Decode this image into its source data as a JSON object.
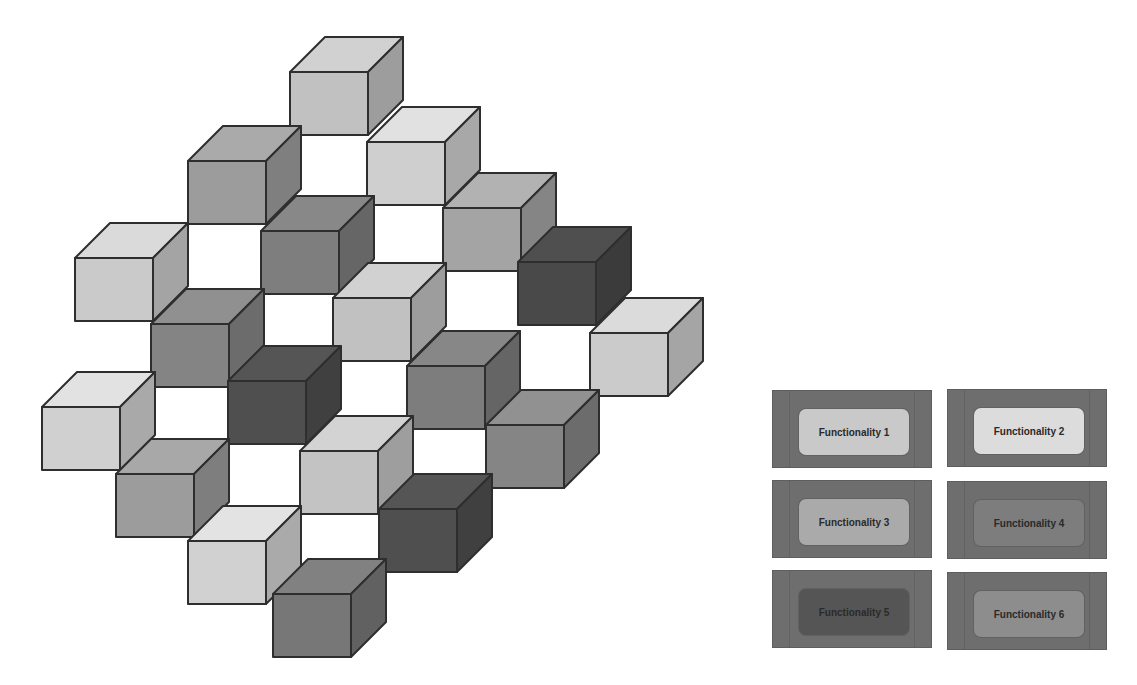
{
  "diagram": {
    "type": "isometric-cube-cluster",
    "cube_geometry": {
      "front_width": 78,
      "front_height": 63,
      "depth_dx": 35,
      "depth_dy": -35
    },
    "cubes": [
      {
        "id": 1,
        "x": 290,
        "y": 72,
        "shade": "light",
        "color": "#c9c9c9"
      },
      {
        "id": 2,
        "x": 188,
        "y": 161,
        "shade": "mid",
        "color": "#a3a3a3"
      },
      {
        "id": 3,
        "x": 367,
        "y": 142,
        "shade": "lightest",
        "color": "#d8d8d8"
      },
      {
        "id": 4,
        "x": 75,
        "y": 258,
        "shade": "lightest",
        "color": "#d2d2d2"
      },
      {
        "id": 5,
        "x": 261,
        "y": 231,
        "shade": "mid-dark",
        "color": "#838383"
      },
      {
        "id": 6,
        "x": 443,
        "y": 208,
        "shade": "mid",
        "color": "#ababab"
      },
      {
        "id": 7,
        "x": 518,
        "y": 262,
        "shade": "dark",
        "color": "#4c4c4c"
      },
      {
        "id": 8,
        "x": 151,
        "y": 324,
        "shade": "mid-dark",
        "color": "#8a8a8a"
      },
      {
        "id": 9,
        "x": 333,
        "y": 298,
        "shade": "light",
        "color": "#c9c9c9"
      },
      {
        "id": 10,
        "x": 590,
        "y": 333,
        "shade": "lightest",
        "color": "#d3d3d3"
      },
      {
        "id": 11,
        "x": 42,
        "y": 407,
        "shade": "lightest",
        "color": "#d9d9d9"
      },
      {
        "id": 12,
        "x": 228,
        "y": 381,
        "shade": "dark",
        "color": "#525252"
      },
      {
        "id": 13,
        "x": 407,
        "y": 366,
        "shade": "mid-dark",
        "color": "#828282"
      },
      {
        "id": 14,
        "x": 116,
        "y": 474,
        "shade": "mid",
        "color": "#a2a2a2"
      },
      {
        "id": 15,
        "x": 300,
        "y": 451,
        "shade": "light",
        "color": "#cbcbcb"
      },
      {
        "id": 16,
        "x": 486,
        "y": 425,
        "shade": "mid-dark",
        "color": "#8b8b8b"
      },
      {
        "id": 17,
        "x": 188,
        "y": 541,
        "shade": "lightest",
        "color": "#dadada"
      },
      {
        "id": 18,
        "x": 379,
        "y": 509,
        "shade": "dark",
        "color": "#525252"
      },
      {
        "id": 19,
        "x": 273,
        "y": 594,
        "shade": "mid-dark",
        "color": "#7c7c7c"
      }
    ]
  },
  "legend": {
    "items": [
      {
        "label": "Functionality 1",
        "fill": "#c9c9c9",
        "x": 772,
        "y": 390
      },
      {
        "label": "Functionality 2",
        "fill": "#dcdcdc",
        "x": 947,
        "y": 389
      },
      {
        "label": "Functionality 3",
        "fill": "#aaaaaa",
        "x": 772,
        "y": 480
      },
      {
        "label": "Functionality 4",
        "fill": "#7d7d7d",
        "x": 947,
        "y": 481
      },
      {
        "label": "Functionality 5",
        "fill": "#555555",
        "x": 772,
        "y": 570
      },
      {
        "label": "Functionality 6",
        "fill": "#8d8d8d",
        "x": 947,
        "y": 572
      }
    ]
  }
}
